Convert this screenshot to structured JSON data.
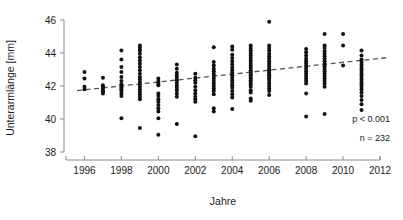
{
  "chart_data": {
    "type": "scatter",
    "title": "",
    "xlabel": "Jahre",
    "ylabel": "Unterarmlänge [mm]",
    "xlim": [
      1995,
      2012
    ],
    "ylim": [
      38,
      46
    ],
    "xticks": [
      1996,
      1998,
      2000,
      2002,
      2004,
      2006,
      2008,
      2010,
      2012
    ],
    "yticks": [
      38,
      40,
      42,
      44,
      46
    ],
    "grid": false,
    "legend": null,
    "annotations": [
      {
        "name": "p-value",
        "text": "p < 0.001"
      },
      {
        "name": "sample-size",
        "text": "n = 232"
      }
    ],
    "trendline": {
      "type": "linear-dashed",
      "x_start": 1995.6,
      "y_start": 41.72,
      "x_end": 2012.4,
      "y_end": 43.72
    },
    "series": [
      {
        "name": "Unterarmlänge Messungen",
        "marker": "filled-circle",
        "color": "#111111",
        "n": 232,
        "points": [
          {
            "x": 1996,
            "y": 42.85
          },
          {
            "x": 1996,
            "y": 42.45
          },
          {
            "x": 1996,
            "y": 41.95
          },
          {
            "x": 1996,
            "y": 41.8
          },
          {
            "x": 1997,
            "y": 42.5
          },
          {
            "x": 1997,
            "y": 42.05
          },
          {
            "x": 1997,
            "y": 41.95
          },
          {
            "x": 1997,
            "y": 41.85
          },
          {
            "x": 1997,
            "y": 41.75
          },
          {
            "x": 1997,
            "y": 41.65
          },
          {
            "x": 1997,
            "y": 41.55
          },
          {
            "x": 1998,
            "y": 44.15
          },
          {
            "x": 1998,
            "y": 43.6
          },
          {
            "x": 1998,
            "y": 43.15
          },
          {
            "x": 1998,
            "y": 42.85
          },
          {
            "x": 1998,
            "y": 42.55
          },
          {
            "x": 1998,
            "y": 42.3
          },
          {
            "x": 1998,
            "y": 42.1
          },
          {
            "x": 1998,
            "y": 42.0
          },
          {
            "x": 1998,
            "y": 41.9
          },
          {
            "x": 1998,
            "y": 41.8
          },
          {
            "x": 1998,
            "y": 41.7
          },
          {
            "x": 1998,
            "y": 41.55
          },
          {
            "x": 1998,
            "y": 41.4
          },
          {
            "x": 1998,
            "y": 40.05
          },
          {
            "x": 1999,
            "y": 44.45
          },
          {
            "x": 1999,
            "y": 44.3
          },
          {
            "x": 1999,
            "y": 44.15
          },
          {
            "x": 1999,
            "y": 43.95
          },
          {
            "x": 1999,
            "y": 43.75
          },
          {
            "x": 1999,
            "y": 43.55
          },
          {
            "x": 1999,
            "y": 43.35
          },
          {
            "x": 1999,
            "y": 43.15
          },
          {
            "x": 1999,
            "y": 42.95
          },
          {
            "x": 1999,
            "y": 42.75
          },
          {
            "x": 1999,
            "y": 42.55
          },
          {
            "x": 1999,
            "y": 42.4
          },
          {
            "x": 1999,
            "y": 42.25
          },
          {
            "x": 1999,
            "y": 42.1
          },
          {
            "x": 1999,
            "y": 41.95
          },
          {
            "x": 1999,
            "y": 41.8
          },
          {
            "x": 1999,
            "y": 41.65
          },
          {
            "x": 1999,
            "y": 41.5
          },
          {
            "x": 1999,
            "y": 41.35
          },
          {
            "x": 1999,
            "y": 41.2
          },
          {
            "x": 1999,
            "y": 39.45
          },
          {
            "x": 2000,
            "y": 42.45
          },
          {
            "x": 2000,
            "y": 42.3
          },
          {
            "x": 2000,
            "y": 42.15
          },
          {
            "x": 2000,
            "y": 42.05
          },
          {
            "x": 2000,
            "y": 41.55
          },
          {
            "x": 2000,
            "y": 41.4
          },
          {
            "x": 2000,
            "y": 41.2
          },
          {
            "x": 2000,
            "y": 41.05
          },
          {
            "x": 2000,
            "y": 40.85
          },
          {
            "x": 2000,
            "y": 40.65
          },
          {
            "x": 2000,
            "y": 40.45
          },
          {
            "x": 2000,
            "y": 40.05
          },
          {
            "x": 2000,
            "y": 39.05
          },
          {
            "x": 2001,
            "y": 43.3
          },
          {
            "x": 2001,
            "y": 43.05
          },
          {
            "x": 2001,
            "y": 42.8
          },
          {
            "x": 2001,
            "y": 42.65
          },
          {
            "x": 2001,
            "y": 42.5
          },
          {
            "x": 2001,
            "y": 42.35
          },
          {
            "x": 2001,
            "y": 42.2
          },
          {
            "x": 2001,
            "y": 42.05
          },
          {
            "x": 2001,
            "y": 41.9
          },
          {
            "x": 2001,
            "y": 41.75
          },
          {
            "x": 2001,
            "y": 41.55
          },
          {
            "x": 2001,
            "y": 41.35
          },
          {
            "x": 2001,
            "y": 39.7
          },
          {
            "x": 2002,
            "y": 42.75
          },
          {
            "x": 2002,
            "y": 42.5
          },
          {
            "x": 2002,
            "y": 42.35
          },
          {
            "x": 2002,
            "y": 42.2
          },
          {
            "x": 2002,
            "y": 41.95
          },
          {
            "x": 2002,
            "y": 41.75
          },
          {
            "x": 2002,
            "y": 41.55
          },
          {
            "x": 2002,
            "y": 41.35
          },
          {
            "x": 2002,
            "y": 41.2
          },
          {
            "x": 2002,
            "y": 41.05
          },
          {
            "x": 2002,
            "y": 38.95
          },
          {
            "x": 2003,
            "y": 44.35
          },
          {
            "x": 2003,
            "y": 43.45
          },
          {
            "x": 2003,
            "y": 43.25
          },
          {
            "x": 2003,
            "y": 43.05
          },
          {
            "x": 2003,
            "y": 42.9
          },
          {
            "x": 2003,
            "y": 42.75
          },
          {
            "x": 2003,
            "y": 42.6
          },
          {
            "x": 2003,
            "y": 42.45
          },
          {
            "x": 2003,
            "y": 42.3
          },
          {
            "x": 2003,
            "y": 42.15
          },
          {
            "x": 2003,
            "y": 42.0
          },
          {
            "x": 2003,
            "y": 41.85
          },
          {
            "x": 2003,
            "y": 41.7
          },
          {
            "x": 2003,
            "y": 41.5
          },
          {
            "x": 2003,
            "y": 40.65
          },
          {
            "x": 2003,
            "y": 40.45
          },
          {
            "x": 2004,
            "y": 44.4
          },
          {
            "x": 2004,
            "y": 44.2
          },
          {
            "x": 2004,
            "y": 43.9
          },
          {
            "x": 2004,
            "y": 43.7
          },
          {
            "x": 2004,
            "y": 43.5
          },
          {
            "x": 2004,
            "y": 43.3
          },
          {
            "x": 2004,
            "y": 43.1
          },
          {
            "x": 2004,
            "y": 42.95
          },
          {
            "x": 2004,
            "y": 42.8
          },
          {
            "x": 2004,
            "y": 42.65
          },
          {
            "x": 2004,
            "y": 42.5
          },
          {
            "x": 2004,
            "y": 42.35
          },
          {
            "x": 2004,
            "y": 42.2
          },
          {
            "x": 2004,
            "y": 42.05
          },
          {
            "x": 2004,
            "y": 41.9
          },
          {
            "x": 2004,
            "y": 41.7
          },
          {
            "x": 2004,
            "y": 41.5
          },
          {
            "x": 2004,
            "y": 41.3
          },
          {
            "x": 2004,
            "y": 40.6
          },
          {
            "x": 2005,
            "y": 44.45
          },
          {
            "x": 2005,
            "y": 44.3
          },
          {
            "x": 2005,
            "y": 44.15
          },
          {
            "x": 2005,
            "y": 44.0
          },
          {
            "x": 2005,
            "y": 43.85
          },
          {
            "x": 2005,
            "y": 43.7
          },
          {
            "x": 2005,
            "y": 43.55
          },
          {
            "x": 2005,
            "y": 43.4
          },
          {
            "x": 2005,
            "y": 43.25
          },
          {
            "x": 2005,
            "y": 43.1
          },
          {
            "x": 2005,
            "y": 42.95
          },
          {
            "x": 2005,
            "y": 42.85
          },
          {
            "x": 2005,
            "y": 42.75
          },
          {
            "x": 2005,
            "y": 42.65
          },
          {
            "x": 2005,
            "y": 42.55
          },
          {
            "x": 2005,
            "y": 42.45
          },
          {
            "x": 2005,
            "y": 42.35
          },
          {
            "x": 2005,
            "y": 42.25
          },
          {
            "x": 2005,
            "y": 42.1
          },
          {
            "x": 2005,
            "y": 41.95
          },
          {
            "x": 2005,
            "y": 41.75
          },
          {
            "x": 2005,
            "y": 41.6
          },
          {
            "x": 2005,
            "y": 41.25
          },
          {
            "x": 2005,
            "y": 41.1
          },
          {
            "x": 2006,
            "y": 45.9
          },
          {
            "x": 2006,
            "y": 44.45
          },
          {
            "x": 2006,
            "y": 44.3
          },
          {
            "x": 2006,
            "y": 44.15
          },
          {
            "x": 2006,
            "y": 43.95
          },
          {
            "x": 2006,
            "y": 43.8
          },
          {
            "x": 2006,
            "y": 43.65
          },
          {
            "x": 2006,
            "y": 43.5
          },
          {
            "x": 2006,
            "y": 43.35
          },
          {
            "x": 2006,
            "y": 43.2
          },
          {
            "x": 2006,
            "y": 43.05
          },
          {
            "x": 2006,
            "y": 42.95
          },
          {
            "x": 2006,
            "y": 42.85
          },
          {
            "x": 2006,
            "y": 42.75
          },
          {
            "x": 2006,
            "y": 42.65
          },
          {
            "x": 2006,
            "y": 42.55
          },
          {
            "x": 2006,
            "y": 42.45
          },
          {
            "x": 2006,
            "y": 42.3
          },
          {
            "x": 2006,
            "y": 42.15
          },
          {
            "x": 2006,
            "y": 42.0
          },
          {
            "x": 2006,
            "y": 41.85
          },
          {
            "x": 2006,
            "y": 41.7
          },
          {
            "x": 2006,
            "y": 41.45
          },
          {
            "x": 2008,
            "y": 44.25
          },
          {
            "x": 2008,
            "y": 44.05
          },
          {
            "x": 2008,
            "y": 43.85
          },
          {
            "x": 2008,
            "y": 43.65
          },
          {
            "x": 2008,
            "y": 43.5
          },
          {
            "x": 2008,
            "y": 43.35
          },
          {
            "x": 2008,
            "y": 43.2
          },
          {
            "x": 2008,
            "y": 43.05
          },
          {
            "x": 2008,
            "y": 42.9
          },
          {
            "x": 2008,
            "y": 42.75
          },
          {
            "x": 2008,
            "y": 42.6
          },
          {
            "x": 2008,
            "y": 42.45
          },
          {
            "x": 2008,
            "y": 42.3
          },
          {
            "x": 2008,
            "y": 42.15
          },
          {
            "x": 2008,
            "y": 41.55
          },
          {
            "x": 2008,
            "y": 40.15
          },
          {
            "x": 2009,
            "y": 45.15
          },
          {
            "x": 2009,
            "y": 44.45
          },
          {
            "x": 2009,
            "y": 44.3
          },
          {
            "x": 2009,
            "y": 44.1
          },
          {
            "x": 2009,
            "y": 43.95
          },
          {
            "x": 2009,
            "y": 43.8
          },
          {
            "x": 2009,
            "y": 43.65
          },
          {
            "x": 2009,
            "y": 43.5
          },
          {
            "x": 2009,
            "y": 43.35
          },
          {
            "x": 2009,
            "y": 43.2
          },
          {
            "x": 2009,
            "y": 43.05
          },
          {
            "x": 2009,
            "y": 42.9
          },
          {
            "x": 2009,
            "y": 42.75
          },
          {
            "x": 2009,
            "y": 42.6
          },
          {
            "x": 2009,
            "y": 42.45
          },
          {
            "x": 2009,
            "y": 42.3
          },
          {
            "x": 2009,
            "y": 42.15
          },
          {
            "x": 2009,
            "y": 41.95
          },
          {
            "x": 2009,
            "y": 40.3
          },
          {
            "x": 2010,
            "y": 45.15
          },
          {
            "x": 2010,
            "y": 44.45
          },
          {
            "x": 2010,
            "y": 43.25
          },
          {
            "x": 2011,
            "y": 44.15
          },
          {
            "x": 2011,
            "y": 43.85
          },
          {
            "x": 2011,
            "y": 43.6
          },
          {
            "x": 2011,
            "y": 43.45
          },
          {
            "x": 2011,
            "y": 43.3
          },
          {
            "x": 2011,
            "y": 43.15
          },
          {
            "x": 2011,
            "y": 43.0
          },
          {
            "x": 2011,
            "y": 42.85
          },
          {
            "x": 2011,
            "y": 42.7
          },
          {
            "x": 2011,
            "y": 42.55
          },
          {
            "x": 2011,
            "y": 42.4
          },
          {
            "x": 2011,
            "y": 42.25
          },
          {
            "x": 2011,
            "y": 42.1
          },
          {
            "x": 2011,
            "y": 41.95
          },
          {
            "x": 2011,
            "y": 41.8
          },
          {
            "x": 2011,
            "y": 41.6
          },
          {
            "x": 2011,
            "y": 41.4
          },
          {
            "x": 2011,
            "y": 41.15
          },
          {
            "x": 2011,
            "y": 40.9
          },
          {
            "x": 2011,
            "y": 40.55
          }
        ]
      }
    ]
  },
  "colors": {
    "point": "#111111",
    "axis": "#8a8a8a",
    "trend": "#555555",
    "text": "#1a1a1a",
    "background": "#ffffff"
  }
}
